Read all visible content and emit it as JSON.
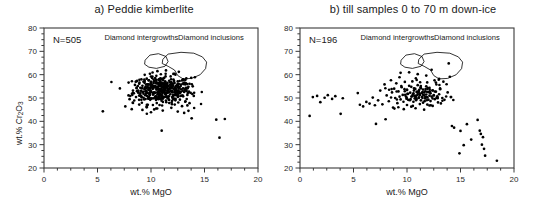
{
  "figure": {
    "background": "#ffffff",
    "point_color": "#000000",
    "axis_color": "#3a3a3a",
    "outline_color": "#000000"
  },
  "panels": [
    {
      "id": "panel-a",
      "title": "a) Peddie kimberlite",
      "n_label": "N=505",
      "annotations": [
        {
          "name": "diamond-intergrowths-label",
          "text": "Diamond intergrowths"
        },
        {
          "name": "diamond-inclusions-label",
          "text": "Diamond inclusions"
        }
      ]
    },
    {
      "id": "panel-b",
      "title": "b) till samples 0 to 70 m down-ice",
      "n_label": "N=196",
      "annotations": [
        {
          "name": "diamond-intergrowths-label",
          "text": "Diamond intergrowths"
        },
        {
          "name": "diamond-inclusions-label",
          "text": "Diamond inclusions"
        }
      ]
    }
  ],
  "axes": {
    "xlabel_prefix": "wt.% MgO",
    "ylabel_prefix": "wt.% Cr",
    "ylabel_sub1": "2",
    "ylabel_mid": "O",
    "ylabel_sub2": "3",
    "xticks": [
      0,
      5,
      10,
      15,
      20
    ],
    "yticks": [
      20,
      30,
      40,
      50,
      60,
      70,
      80
    ],
    "xlim": [
      0,
      20
    ],
    "ylim": [
      20,
      80
    ]
  },
  "chart_data": {
    "type": "scatter",
    "xlabel": "wt.% MgO",
    "ylabel": "wt.% Cr2O3",
    "xlim": [
      0,
      20
    ],
    "ylim": [
      20,
      80
    ],
    "xticks": [
      0,
      5,
      10,
      15,
      20
    ],
    "yticks": [
      20,
      30,
      40,
      50,
      60,
      70,
      80
    ],
    "grid": false,
    "legend": "none",
    "series": [
      {
        "name": "a) Peddie kimberlite",
        "n": 505,
        "points": [
          [
            5.5,
            44.3
          ],
          [
            7.6,
            46.4
          ],
          [
            8.0,
            49.5
          ],
          [
            8.2,
            45.2
          ],
          [
            8.4,
            52.0
          ],
          [
            8.5,
            55.6
          ],
          [
            8.6,
            50.4
          ],
          [
            8.7,
            57.3
          ],
          [
            8.8,
            53.2
          ],
          [
            8.9,
            56.1
          ],
          [
            9.0,
            51.0
          ],
          [
            9.0,
            54.4
          ],
          [
            9.1,
            58.0
          ],
          [
            9.1,
            49.2
          ],
          [
            9.2,
            55.2
          ],
          [
            9.2,
            52.6
          ],
          [
            9.3,
            57.0
          ],
          [
            9.3,
            50.1
          ],
          [
            9.4,
            53.8
          ],
          [
            9.4,
            56.5
          ],
          [
            9.5,
            51.7
          ],
          [
            9.5,
            54.9
          ],
          [
            9.6,
            58.3
          ],
          [
            9.6,
            52.2
          ],
          [
            9.7,
            55.8
          ],
          [
            9.7,
            50.6
          ],
          [
            9.8,
            53.4
          ],
          [
            9.8,
            57.6
          ],
          [
            9.9,
            51.3
          ],
          [
            9.9,
            54.2
          ],
          [
            10.0,
            56.9
          ],
          [
            10.0,
            52.8
          ],
          [
            10.0,
            49.8
          ],
          [
            10.1,
            55.4
          ],
          [
            10.1,
            58.6
          ],
          [
            10.2,
            51.9
          ],
          [
            10.2,
            54.6
          ],
          [
            10.3,
            57.2
          ],
          [
            10.3,
            52.4
          ],
          [
            10.4,
            55.0
          ],
          [
            10.4,
            50.2
          ],
          [
            10.5,
            53.6
          ],
          [
            10.5,
            56.3
          ],
          [
            10.6,
            51.5
          ],
          [
            10.6,
            54.8
          ],
          [
            10.7,
            57.8
          ],
          [
            10.7,
            52.1
          ],
          [
            10.8,
            55.6
          ],
          [
            10.8,
            50.8
          ],
          [
            10.9,
            53.0
          ],
          [
            10.9,
            56.7
          ],
          [
            11.0,
            51.2
          ],
          [
            11.0,
            54.4
          ],
          [
            11.0,
            58.1
          ],
          [
            11.1,
            52.7
          ],
          [
            11.1,
            55.9
          ],
          [
            11.2,
            50.4
          ],
          [
            11.2,
            53.5
          ],
          [
            11.3,
            57.0
          ],
          [
            11.3,
            51.8
          ],
          [
            11.4,
            54.7
          ],
          [
            11.4,
            48.9
          ],
          [
            11.5,
            56.2
          ],
          [
            11.5,
            52.3
          ],
          [
            11.6,
            55.1
          ],
          [
            11.6,
            50.0
          ],
          [
            11.7,
            53.9
          ],
          [
            11.7,
            57.4
          ],
          [
            11.8,
            51.6
          ],
          [
            11.8,
            54.3
          ],
          [
            11.9,
            56.8
          ],
          [
            11.9,
            52.9
          ],
          [
            12.0,
            50.5
          ],
          [
            12.0,
            55.5
          ],
          [
            12.0,
            53.1
          ],
          [
            12.1,
            57.9
          ],
          [
            12.1,
            51.1
          ],
          [
            12.2,
            54.0
          ],
          [
            12.2,
            56.4
          ],
          [
            12.3,
            52.5
          ],
          [
            12.3,
            49.6
          ],
          [
            12.4,
            55.3
          ],
          [
            12.4,
            53.3
          ],
          [
            12.5,
            57.1
          ],
          [
            12.5,
            51.4
          ],
          [
            12.6,
            54.5
          ],
          [
            12.6,
            56.0
          ],
          [
            12.7,
            52.0
          ],
          [
            12.7,
            49.3
          ],
          [
            12.8,
            55.7
          ],
          [
            12.8,
            53.7
          ],
          [
            12.9,
            51.0
          ],
          [
            12.9,
            57.5
          ],
          [
            13.0,
            54.1
          ],
          [
            13.0,
            50.7
          ],
          [
            13.1,
            56.6
          ],
          [
            13.1,
            52.6
          ],
          [
            13.2,
            48.4
          ],
          [
            13.2,
            55.8
          ],
          [
            13.3,
            53.0
          ],
          [
            13.3,
            58.4
          ],
          [
            13.4,
            51.3
          ],
          [
            13.4,
            46.8
          ],
          [
            13.5,
            54.8
          ],
          [
            13.5,
            44.5
          ],
          [
            13.6,
            56.1
          ],
          [
            13.7,
            52.2
          ],
          [
            13.8,
            41.3
          ],
          [
            13.9,
            55.0
          ],
          [
            14.0,
            50.9
          ],
          [
            14.1,
            58.9
          ],
          [
            11.0,
            36.0
          ],
          [
            16.1,
            40.7
          ],
          [
            16.4,
            33.0
          ],
          [
            16.9,
            41.0
          ],
          [
            10.6,
            61.5
          ],
          [
            11.4,
            61.8
          ],
          [
            12.6,
            61.2
          ],
          [
            9.9,
            60.4
          ],
          [
            8.9,
            47.2
          ],
          [
            9.6,
            46.0
          ],
          [
            10.3,
            45.1
          ],
          [
            11.1,
            44.6
          ],
          [
            11.9,
            45.8
          ],
          [
            12.5,
            44.2
          ],
          [
            13.1,
            43.6
          ],
          [
            7.9,
            51.1
          ],
          [
            8.3,
            48.0
          ],
          [
            12.9,
            46.5
          ],
          [
            13.6,
            47.8
          ],
          [
            10.8,
            47.0
          ],
          [
            9.2,
            44.9
          ],
          [
            10.0,
            43.9
          ]
        ]
      },
      {
        "name": "b) till samples 0 to 70 m down-ice",
        "n": 196,
        "points": [
          [
            0.9,
            42.3
          ],
          [
            1.2,
            50.4
          ],
          [
            1.6,
            50.9
          ],
          [
            1.9,
            48.2
          ],
          [
            2.3,
            50.1
          ],
          [
            2.6,
            51.2
          ],
          [
            3.0,
            49.6
          ],
          [
            3.3,
            50.8
          ],
          [
            3.8,
            43.2
          ],
          [
            4.0,
            49.9
          ],
          [
            5.4,
            52.1
          ],
          [
            5.6,
            47.1
          ],
          [
            5.9,
            46.4
          ],
          [
            6.2,
            48.3
          ],
          [
            6.5,
            47.6
          ],
          [
            6.8,
            50.2
          ],
          [
            7.0,
            46.9
          ],
          [
            7.1,
            38.9
          ],
          [
            7.3,
            49.0
          ],
          [
            7.5,
            53.2
          ],
          [
            7.7,
            47.3
          ],
          [
            7.9,
            55.8
          ],
          [
            8.0,
            40.9
          ],
          [
            8.1,
            51.1
          ],
          [
            8.3,
            48.6
          ],
          [
            8.5,
            57.6
          ],
          [
            8.6,
            52.4
          ],
          [
            8.7,
            45.9
          ],
          [
            8.8,
            54.0
          ],
          [
            8.9,
            50.0
          ],
          [
            9.0,
            56.3
          ],
          [
            9.1,
            47.8
          ],
          [
            9.2,
            52.8
          ],
          [
            9.3,
            58.9
          ],
          [
            9.4,
            49.4
          ],
          [
            9.5,
            54.6
          ],
          [
            9.6,
            51.3
          ],
          [
            9.7,
            45.2
          ],
          [
            9.8,
            56.9
          ],
          [
            9.9,
            50.6
          ],
          [
            10.0,
            53.5
          ],
          [
            10.0,
            47.0
          ],
          [
            10.1,
            51.8
          ],
          [
            10.2,
            55.2
          ],
          [
            10.2,
            49.1
          ],
          [
            10.3,
            52.3
          ],
          [
            10.4,
            46.3
          ],
          [
            10.4,
            54.8
          ],
          [
            10.5,
            50.8
          ],
          [
            10.5,
            57.1
          ],
          [
            10.6,
            52.0
          ],
          [
            10.6,
            48.4
          ],
          [
            10.7,
            51.0
          ],
          [
            10.7,
            53.9
          ],
          [
            10.8,
            50.2
          ],
          [
            10.8,
            45.6
          ],
          [
            10.9,
            52.6
          ],
          [
            10.9,
            49.6
          ],
          [
            11.0,
            51.4
          ],
          [
            11.0,
            55.5
          ],
          [
            11.1,
            50.0
          ],
          [
            11.1,
            53.1
          ],
          [
            11.2,
            47.4
          ],
          [
            11.2,
            51.7
          ],
          [
            11.3,
            49.0
          ],
          [
            11.3,
            54.2
          ],
          [
            11.4,
            52.2
          ],
          [
            11.4,
            50.5
          ],
          [
            11.5,
            48.0
          ],
          [
            11.5,
            53.6
          ],
          [
            11.6,
            51.1
          ],
          [
            11.6,
            45.0
          ],
          [
            11.7,
            52.9
          ],
          [
            11.7,
            49.8
          ],
          [
            11.8,
            51.5
          ],
          [
            11.8,
            55.0
          ],
          [
            11.9,
            50.3
          ],
          [
            11.9,
            47.2
          ],
          [
            12.0,
            52.5
          ],
          [
            12.0,
            49.3
          ],
          [
            12.1,
            51.0
          ],
          [
            12.1,
            54.4
          ],
          [
            12.2,
            48.7
          ],
          [
            12.2,
            52.0
          ],
          [
            12.3,
            50.6
          ],
          [
            12.4,
            53.3
          ],
          [
            12.4,
            46.6
          ],
          [
            12.5,
            51.2
          ],
          [
            12.6,
            49.5
          ],
          [
            12.7,
            52.7
          ],
          [
            12.8,
            50.1
          ],
          [
            12.9,
            48.1
          ],
          [
            13.0,
            51.6
          ],
          [
            13.1,
            53.8
          ],
          [
            13.3,
            50.0
          ],
          [
            13.5,
            49.2
          ],
          [
            9.4,
            60.8
          ],
          [
            10.2,
            61.0
          ],
          [
            11.0,
            60.2
          ],
          [
            11.8,
            59.6
          ],
          [
            12.3,
            62.1
          ],
          [
            13.0,
            58.2
          ],
          [
            13.4,
            57.0
          ],
          [
            13.9,
            64.8
          ],
          [
            14.0,
            59.1
          ],
          [
            14.2,
            38.0
          ],
          [
            14.4,
            37.3
          ],
          [
            14.9,
            26.3
          ],
          [
            15.0,
            35.9
          ],
          [
            15.3,
            29.8
          ],
          [
            15.6,
            38.8
          ],
          [
            16.0,
            32.2
          ],
          [
            16.6,
            40.6
          ],
          [
            16.8,
            36.0
          ],
          [
            16.9,
            34.6
          ],
          [
            17.0,
            30.0
          ],
          [
            17.1,
            33.2
          ],
          [
            17.2,
            28.2
          ],
          [
            17.3,
            25.3
          ],
          [
            18.4,
            23.1
          ],
          [
            13.7,
            55.9
          ],
          [
            13.8,
            52.4
          ],
          [
            14.1,
            50.4
          ],
          [
            12.7,
            56.6
          ]
        ]
      }
    ],
    "annotation_fields": [
      {
        "name": "Diamond intergrowths",
        "approx_mgo_range": [
          9.5,
          11.5
        ],
        "approx_cr2o3_range": [
          63,
          69
        ]
      },
      {
        "name": "Diamond inclusions",
        "approx_mgo_range": [
          11.0,
          15.5
        ],
        "approx_cr2o3_range": [
          58,
          70
        ]
      }
    ]
  }
}
